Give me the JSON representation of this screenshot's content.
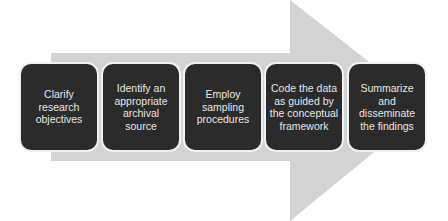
{
  "diagram": {
    "type": "process-arrow-flow",
    "arrow_color": "#d3d3d3",
    "box_color": "#2b2b2b",
    "text_color": "#e6e6e6",
    "steps": [
      {
        "label": "Clarify\nresearch\nobjectives"
      },
      {
        "label": "Identify an\nappropriate\narchival source"
      },
      {
        "label": "Employ\nsampling\nprocedures"
      },
      {
        "label": "Code the data\nas guided by\nthe conceptual\nframework"
      },
      {
        "label": "Summarize\nand\ndisseminate\nthe findings"
      }
    ]
  }
}
